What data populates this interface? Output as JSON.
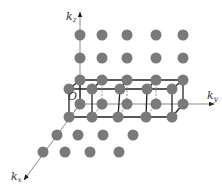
{
  "figure": {
    "title": ""
  },
  "colors": {
    "lattice_point": "#7a7a7a",
    "axis": "#8a8a8a",
    "box": "#222222",
    "dashed": "#888888",
    "label": "#333333"
  },
  "axes": {
    "kz": {
      "label": "k",
      "subscript": "z",
      "from": [
        80,
        104
      ],
      "to": [
        80,
        12
      ],
      "label_pos": [
        66,
        20
      ]
    },
    "ky": {
      "label": "k",
      "subscript": "y",
      "from": [
        80,
        104
      ],
      "to": [
        214,
        104
      ],
      "label_pos": [
        207,
        99
      ]
    },
    "kx": {
      "label": "k",
      "subscript": "x",
      "from": [
        80,
        104
      ],
      "to": [
        24,
        180
      ],
      "label_pos": [
        11,
        180
      ]
    },
    "origin": {
      "label": "O",
      "pos": [
        68,
        100
      ]
    }
  },
  "lattice_points": {
    "radius": 5.5,
    "rows": [
      {
        "name": "back-top-high",
        "y": 35,
        "x": [
          80,
          102,
          127,
          156,
          183
        ]
      },
      {
        "name": "back-top-mid",
        "y": 58,
        "x": [
          80,
          102,
          127,
          156,
          183
        ]
      },
      {
        "name": "box-back-top",
        "y": 80,
        "x": [
          80,
          102,
          127,
          156,
          183
        ]
      },
      {
        "name": "box-front-top",
        "y": 89,
        "x": [
          69,
          92,
          120,
          147,
          172
        ]
      },
      {
        "name": "box-back-bottom",
        "y": 104,
        "x": [
          80,
          102,
          127,
          156,
          183
        ]
      },
      {
        "name": "box-front-bottom",
        "y": 117,
        "x": [
          69,
          92,
          118,
          146,
          172
        ]
      },
      {
        "name": "front-row-1",
        "y": 135,
        "x": [
          57,
          78,
          103,
          133
        ]
      },
      {
        "name": "front-row-2",
        "y": 152,
        "x": [
          43,
          65,
          90,
          119
        ]
      }
    ]
  },
  "box": {
    "back_top": [
      [
        80,
        80
      ],
      [
        183,
        80
      ]
    ],
    "front_top": [
      [
        69,
        89
      ],
      [
        172,
        89
      ]
    ],
    "back_bottom": [
      [
        80,
        104
      ],
      [
        183,
        104
      ]
    ],
    "front_bottom": [
      [
        69,
        117
      ],
      [
        172,
        117
      ]
    ]
  }
}
